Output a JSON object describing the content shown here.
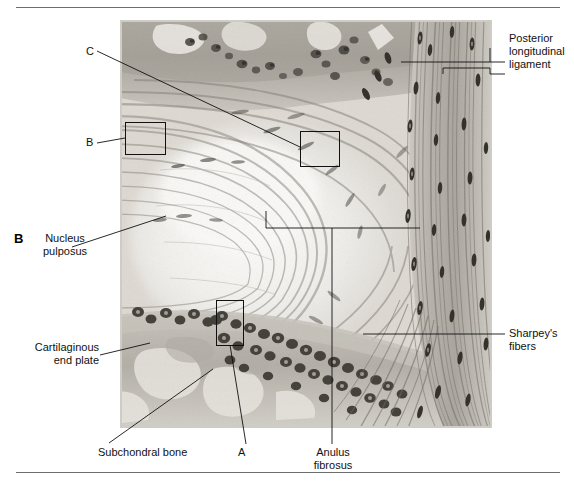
{
  "figure": {
    "panel_letter": "B",
    "type": "histology-micrograph"
  },
  "labels": {
    "posterior_longitudinal_ligament": "Posterior\nlongitudinal\nligament",
    "sharpeys_fibers": "Sharpey's\nfibers",
    "nucleus_pulposus": "Nucleus\npulposus",
    "cartilaginous_end_plate": "Cartilaginous\nend plate",
    "subchondral_bone": "Subchondral bone",
    "anulus_fibrosus": "Anulus\nfibrosus"
  },
  "markers": {
    "a": "A",
    "b": "B",
    "c": "C"
  },
  "colors": {
    "rule": "#6d6d6d",
    "leader": "#1a1a1a",
    "box": "#111111",
    "text": "#111111"
  }
}
